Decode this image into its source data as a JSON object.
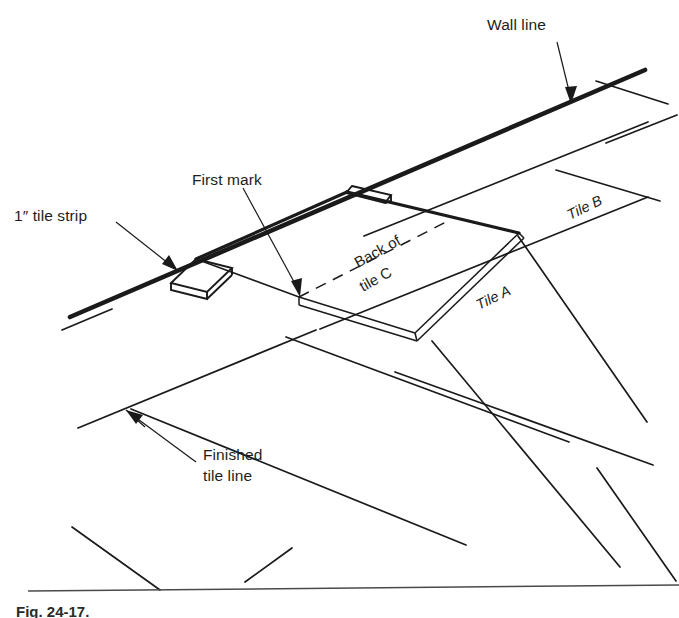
{
  "figure": {
    "domain": "diagram",
    "kind": "technical-line-illustration",
    "background_color": "#ffffff",
    "ink_color": "#1a1a1a",
    "width": 679,
    "height": 618
  },
  "labels": {
    "wall_line": "Wall line",
    "first_mark": "First mark",
    "tile_strip": "1″ tile strip",
    "back_of_tile_c_line1": "Back of",
    "back_of_tile_c_line2": "tile C",
    "tile_a": "Tile A",
    "tile_b": "Tile B",
    "finished_tile_line_line1": "Finished",
    "finished_tile_line_line2": "tile line"
  },
  "caption": {
    "text": "Fig. 24-17.",
    "clipped": true
  },
  "geometry": {
    "wall_line": {
      "x1": 70,
      "y1": 317,
      "x2": 645,
      "y2": 70
    },
    "tile_c": {
      "top_left": {
        "x": 347,
        "y": 192
      },
      "top_right": {
        "x": 519,
        "y": 233
      },
      "bottom_right": {
        "x": 415,
        "y": 333
      },
      "bottom_left": {
        "x": 299,
        "y": 297
      },
      "thickness_px": 8
    },
    "tile_strip": {
      "top_left": {
        "x": 196,
        "y": 259
      },
      "top_right": {
        "x": 232,
        "y": 268
      },
      "bottom_right": {
        "x": 207,
        "y": 292
      },
      "bottom_left": {
        "x": 171,
        "y": 283
      },
      "thickness_px": 7
    },
    "tab_strip": {
      "top_left": {
        "x": 352,
        "y": 186
      },
      "top_right": {
        "x": 390,
        "y": 194
      },
      "bottom_right": {
        "x": 383,
        "y": 201
      },
      "bottom_left": {
        "x": 346,
        "y": 193
      }
    },
    "first_mark_point": {
      "x": 299,
      "y": 297
    },
    "finished_tile_line_point": {
      "x": 126,
      "y": 410
    },
    "baseline_rule": {
      "x1": 28,
      "y1": 591,
      "x2": 679,
      "y2": 585
    }
  },
  "annotations": [
    {
      "name": "wall-line",
      "label": "Wall line",
      "anchor": {
        "x": 571,
        "y": 103
      }
    },
    {
      "name": "first-mark",
      "label": "First mark",
      "anchor": {
        "x": 299,
        "y": 297
      }
    },
    {
      "name": "tile-strip",
      "label": "1″ tile strip",
      "anchor": {
        "x": 176,
        "y": 270
      }
    },
    {
      "name": "finished-tile-line",
      "label": "Finished tile line",
      "anchor": {
        "x": 126,
        "y": 410
      }
    }
  ]
}
